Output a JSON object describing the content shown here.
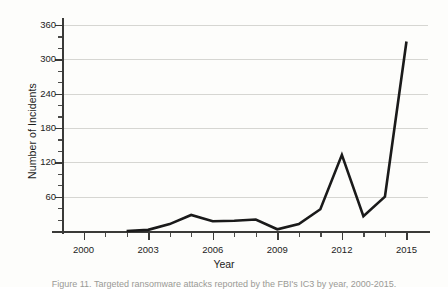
{
  "figure": {
    "caption": "Figure 11. Targeted ransomware attacks reported by the FBI's IC3 by year, 2000-2015.",
    "caption_link_text": "FBI's IC3"
  },
  "axes": {
    "y_title": "Number of Incidents",
    "x_title": "Year",
    "y_ticks": [
      "60",
      "120",
      "180",
      "240",
      "300",
      "360"
    ],
    "y_tick_values": [
      60,
      120,
      180,
      240,
      300,
      360
    ],
    "x_ticks": [
      "2000",
      "2003",
      "2006",
      "2009",
      "2012",
      "2015"
    ],
    "x_tick_values": [
      2000,
      2003,
      2006,
      2009,
      2012,
      2015
    ]
  },
  "style": {
    "line_color": "#1a1a1a",
    "grid_color": "#d6d6d2",
    "axis_color": "#3a3a38",
    "background": "#fdfdfb"
  },
  "chart_data": {
    "type": "line",
    "title": "",
    "xlabel": "Year",
    "ylabel": "Number of Incidents",
    "xlim": [
      1999,
      2016
    ],
    "ylim": [
      0,
      372
    ],
    "grid": true,
    "legend": false,
    "x": [
      2002,
      2003,
      2004,
      2005,
      2006,
      2007,
      2008,
      2009,
      2010,
      2011,
      2012,
      2013,
      2014,
      2015
    ],
    "series": [
      {
        "name": "Number of Incidents",
        "values": [
          0,
          2,
          12,
          28,
          17,
          18,
          20,
          3,
          12,
          38,
          133,
          26,
          60,
          331
        ]
      }
    ]
  }
}
